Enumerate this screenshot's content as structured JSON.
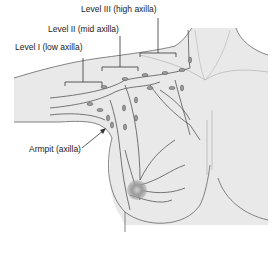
{
  "labels": {
    "level3": "Level III (high axilla)",
    "level2": "Level II (mid axilla)",
    "level1": "Level I (low axilla)",
    "armpit": "Armpit (axilla)"
  },
  "colors": {
    "skin": "#e9e9e9",
    "outline": "#555555",
    "vessel": "#555555",
    "node": "#9a9a9a",
    "tumor": "#8f8f8f"
  }
}
